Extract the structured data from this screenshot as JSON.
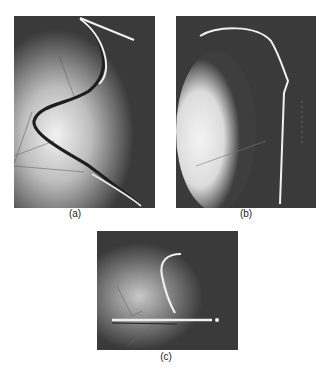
{
  "figure": {
    "panels": [
      {
        "id": "a",
        "label": "(a)",
        "description": "S-shaped bright wire on dark background with light diffuse glow and faint thin lines"
      },
      {
        "id": "b",
        "label": "(b)",
        "description": "Hook-shaped bright wire over large bright elliptical glow on left"
      },
      {
        "id": "c",
        "label": "(c)",
        "description": "Curved bright wire rising from a horizontal bright bar with faint lines"
      }
    ]
  }
}
